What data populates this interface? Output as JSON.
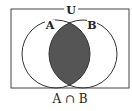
{
  "diagram": {
    "universe_label": "U",
    "set_a_label": "A",
    "set_b_label": "B",
    "caption": "A ∩ B",
    "shaded_region": "intersection",
    "colors": {
      "stroke": "#333333",
      "shade": "#555555",
      "background": "#ffffff"
    }
  }
}
